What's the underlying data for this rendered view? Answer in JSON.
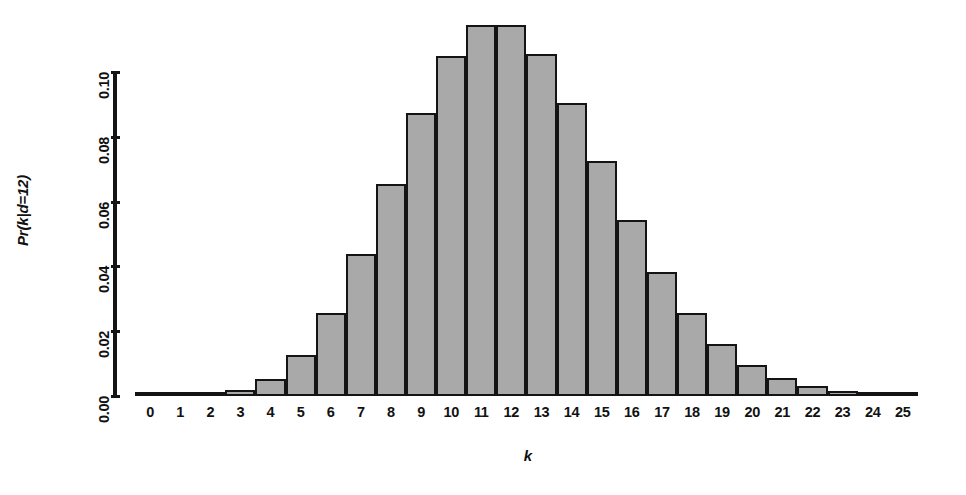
{
  "chart_data": {
    "type": "bar",
    "title": "",
    "subtitle": "",
    "xlabel": "k",
    "ylabel": "Pr(k|d=12)",
    "categories": [
      "0",
      "1",
      "2",
      "3",
      "4",
      "5",
      "6",
      "7",
      "8",
      "9",
      "10",
      "11",
      "12",
      "13",
      "14",
      "15",
      "16",
      "17",
      "18",
      "19",
      "20",
      "21",
      "22",
      "23",
      "24",
      "25"
    ],
    "values": [
      0.0,
      0.0001,
      0.0004,
      0.0018,
      0.0053,
      0.0127,
      0.0255,
      0.0437,
      0.0655,
      0.0874,
      0.1048,
      0.1144,
      0.1144,
      0.1056,
      0.0905,
      0.0724,
      0.0543,
      0.0383,
      0.0256,
      0.0161,
      0.0097,
      0.0055,
      0.003,
      0.0016,
      0.0008,
      0.0004
    ],
    "series": [
      {
        "name": "Pr(k|d=12)",
        "values": [
          0.0,
          0.0001,
          0.0004,
          0.0018,
          0.0053,
          0.0127,
          0.0255,
          0.0437,
          0.0655,
          0.0874,
          0.1048,
          0.1144,
          0.1144,
          0.1056,
          0.0905,
          0.0724,
          0.0543,
          0.0383,
          0.0256,
          0.0161,
          0.0097,
          0.0055,
          0.003,
          0.0016,
          0.0008,
          0.0004
        ]
      }
    ],
    "xlim": [
      -0.5,
      25.5
    ],
    "ylim": [
      0.0,
      0.1
    ],
    "y_axis_max_drawn": 0.1,
    "yticks": [
      0.0,
      0.02,
      0.04,
      0.06,
      0.08,
      0.1
    ],
    "ytick_labels": [
      "0.00",
      "0.02",
      "0.04",
      "0.06",
      "0.08",
      "0.10"
    ],
    "xtick_labels": [
      "0",
      "1",
      "2",
      "3",
      "4",
      "5",
      "6",
      "7",
      "8",
      "9",
      "10",
      "11",
      "12",
      "13",
      "14",
      "15",
      "16",
      "17",
      "18",
      "19",
      "20",
      "21",
      "22",
      "23",
      "24",
      "25"
    ],
    "grid": false,
    "legend": false,
    "legend_position": "none",
    "bar_fill_color": "#a9a9a9",
    "bar_border_color": "#141414",
    "axis_color": "#151515",
    "background_color": "#ffffff",
    "annotations": []
  }
}
